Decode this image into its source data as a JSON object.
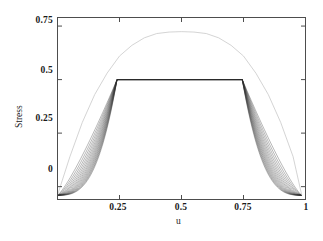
{
  "chart_data": {
    "type": "line",
    "title": "",
    "xlabel": "u",
    "ylabel": "Stress",
    "xlim": [
      0,
      1
    ],
    "ylim": [
      -0.06,
      0.79
    ],
    "grid": false,
    "legend": null,
    "xticks": [
      0.25,
      0.5,
      0.75,
      1
    ],
    "xtick_labels": [
      "0.25",
      "0.5",
      "0.75",
      "1"
    ],
    "yticks": [
      0,
      0.25,
      0.5,
      0.75
    ],
    "ytick_labels": [
      "0",
      "0.25",
      "0.5",
      "0.75"
    ],
    "plateau_value": 0.5,
    "plateau_u_start": 0.24,
    "plateau_u_end": 0.745,
    "curve_start_u": 0.0,
    "curve_end_u": 0.985,
    "curve_start_stress": -0.04,
    "curve_end_stress": -0.04,
    "series": [
      {
        "name": "envelope-parabola",
        "color": "#c9c9c9",
        "width": 0.8,
        "points": [
          [
            0.0,
            -0.04
          ],
          [
            0.05,
            0.14
          ],
          [
            0.1,
            0.3
          ],
          [
            0.15,
            0.43
          ],
          [
            0.2,
            0.53
          ],
          [
            0.25,
            0.61
          ],
          [
            0.3,
            0.66
          ],
          [
            0.35,
            0.695
          ],
          [
            0.4,
            0.715
          ],
          [
            0.45,
            0.722
          ],
          [
            0.5,
            0.724
          ],
          [
            0.55,
            0.722
          ],
          [
            0.6,
            0.715
          ],
          [
            0.65,
            0.695
          ],
          [
            0.7,
            0.66
          ],
          [
            0.75,
            0.61
          ],
          [
            0.8,
            0.53
          ],
          [
            0.85,
            0.43
          ],
          [
            0.9,
            0.3
          ],
          [
            0.95,
            0.14
          ],
          [
            0.985,
            -0.04
          ]
        ]
      },
      {
        "name": "stress-family",
        "color": "#2b2b2b",
        "width": 0.55,
        "count": 16,
        "sharpness_min": 1.0,
        "sharpness_max": 9.0
      }
    ]
  },
  "axes": {
    "frame_color": "#4d4d4d",
    "tick_color": "#4d4d4d"
  }
}
